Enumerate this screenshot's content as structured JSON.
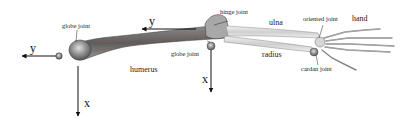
{
  "diagram": {
    "type": "anatomical skeleton with joint model",
    "bones": [
      "humerus",
      "ulna",
      "radius",
      "hand"
    ],
    "joints": {
      "shoulder": "globe joint",
      "elbow_upper": "hinge joint",
      "elbow_lower": "globe joint",
      "wrist_upper": "oriented joint",
      "wrist_lower": "cardan joint"
    },
    "axes": {
      "shoulder": {
        "y": "y",
        "x": "x"
      },
      "elbow": {
        "y": "y",
        "x": "x"
      }
    },
    "colors": {
      "bone_upper": "#6e6e6e",
      "bone_lower": "#d8d8d8",
      "joint": "#8a8a8a",
      "arrow": "#111111",
      "background": "#ffffff"
    }
  }
}
